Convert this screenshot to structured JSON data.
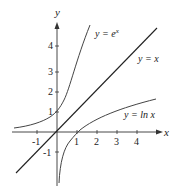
{
  "diagram": {
    "axes": {
      "x_label": "x",
      "y_label": "y"
    },
    "x_ticks": [
      "-1",
      "1",
      "2",
      "3",
      "4"
    ],
    "y_ticks": [
      "-1",
      "1",
      "2",
      "3",
      "4"
    ],
    "curves": [
      {
        "name": "exp",
        "label_prefix": "y = e",
        "label_sup": "x"
      },
      {
        "name": "identity",
        "label": "y = x"
      },
      {
        "name": "ln",
        "label": "y = ln x"
      }
    ]
  }
}
